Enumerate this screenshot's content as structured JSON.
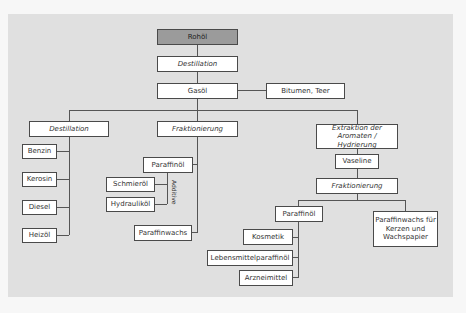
{
  "diagram": {
    "root": "Rohöl",
    "step1": "Destillation",
    "gasoel": "Gasöl",
    "bitumen": "Bitumen, Teer",
    "branches": {
      "left": {
        "process": "Destillation",
        "products": [
          "Benzin",
          "Kerosin",
          "Diesel",
          "Heizöl"
        ]
      },
      "middle": {
        "process": "Fraktionierung",
        "paraffinoel": "Paraffinöl",
        "additive_products": [
          "Schmieröl",
          "Hydrauliköl"
        ],
        "additive_label": "Additive",
        "paraffinwachs": "Paraffinwachs"
      },
      "right": {
        "process_line1": "Extraktion der",
        "process_line2": "Aromaten / Hydrierung",
        "vaseline": "Vaseline",
        "process2": "Fraktionierung",
        "paraffinoel": "Paraffinöl",
        "paraffinoel_products": [
          "Kosmetik",
          "Lebensmittelparaffinöl",
          "Arzneimittel"
        ],
        "wachs_line1": "Paraffinwachs für",
        "wachs_line2": "Kerzen und",
        "wachs_line3": "Wachspapier"
      }
    },
    "colors": {
      "panel_bg": "#e0e0e0",
      "root_fill": "#9b9b9b",
      "box_fill": "#ffffff",
      "line": "#555555"
    }
  }
}
